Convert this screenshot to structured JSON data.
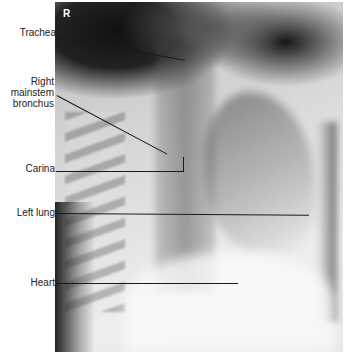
{
  "image": {
    "description": "Chest X-ray, oblique view, with anatomical labels",
    "orientation_marker": "R"
  },
  "labels": [
    {
      "id": "trachea",
      "text": "Trachea"
    },
    {
      "id": "right-mainstem-bronchus",
      "lines": [
        "Right",
        "mainstem",
        "bronchus"
      ]
    },
    {
      "id": "carina",
      "text": "Carina"
    },
    {
      "id": "left-lung",
      "text": "Left lung"
    },
    {
      "id": "heart",
      "text": "Heart"
    }
  ]
}
